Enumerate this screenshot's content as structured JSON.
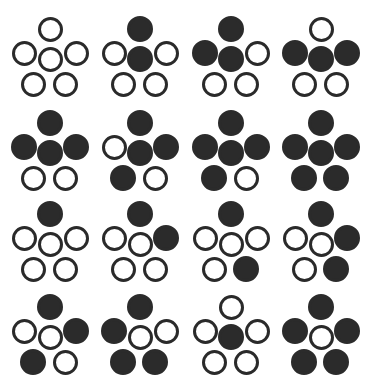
{
  "caption": {
    "text": ""
  },
  "layout": {
    "columns": 4,
    "rows": 4,
    "col_x": [
      0,
      90,
      181,
      271
    ],
    "row_y": [
      0,
      94,
      185,
      278
    ]
  },
  "colors": {
    "ink": "#2a2a2a",
    "background": "#ffffff"
  },
  "positions": [
    "top",
    "left",
    "center",
    "right",
    "bottom_left",
    "bottom_right"
  ],
  "patterns": [
    {
      "id": 1,
      "filled": {
        "top": false,
        "left": false,
        "center": false,
        "right": false,
        "bottom_left": false,
        "bottom_right": false
      }
    },
    {
      "id": 2,
      "filled": {
        "top": true,
        "left": false,
        "center": true,
        "right": false,
        "bottom_left": false,
        "bottom_right": false
      }
    },
    {
      "id": 3,
      "filled": {
        "top": true,
        "left": true,
        "center": true,
        "right": false,
        "bottom_left": false,
        "bottom_right": false
      }
    },
    {
      "id": 4,
      "filled": {
        "top": false,
        "left": true,
        "center": true,
        "right": true,
        "bottom_left": false,
        "bottom_right": false
      }
    },
    {
      "id": 5,
      "filled": {
        "top": true,
        "left": true,
        "center": true,
        "right": true,
        "bottom_left": false,
        "bottom_right": false
      }
    },
    {
      "id": 6,
      "filled": {
        "top": true,
        "left": false,
        "center": true,
        "right": true,
        "bottom_left": true,
        "bottom_right": false
      }
    },
    {
      "id": 7,
      "filled": {
        "top": true,
        "left": true,
        "center": true,
        "right": true,
        "bottom_left": true,
        "bottom_right": false
      }
    },
    {
      "id": 8,
      "filled": {
        "top": true,
        "left": true,
        "center": true,
        "right": true,
        "bottom_left": true,
        "bottom_right": true
      }
    },
    {
      "id": 9,
      "filled": {
        "top": true,
        "left": false,
        "center": false,
        "right": false,
        "bottom_left": false,
        "bottom_right": false
      }
    },
    {
      "id": 10,
      "filled": {
        "top": true,
        "left": false,
        "center": false,
        "right": true,
        "bottom_left": false,
        "bottom_right": false
      }
    },
    {
      "id": 11,
      "filled": {
        "top": true,
        "left": false,
        "center": false,
        "right": false,
        "bottom_left": false,
        "bottom_right": true
      }
    },
    {
      "id": 12,
      "filled": {
        "top": true,
        "left": false,
        "center": false,
        "right": true,
        "bottom_left": false,
        "bottom_right": true
      }
    },
    {
      "id": 13,
      "filled": {
        "top": true,
        "left": false,
        "center": false,
        "right": true,
        "bottom_left": true,
        "bottom_right": false
      }
    },
    {
      "id": 14,
      "filled": {
        "top": true,
        "left": true,
        "center": false,
        "right": false,
        "bottom_left": true,
        "bottom_right": true
      }
    },
    {
      "id": 15,
      "filled": {
        "top": false,
        "left": false,
        "center": true,
        "right": false,
        "bottom_left": false,
        "bottom_right": false
      }
    },
    {
      "id": 16,
      "filled": {
        "top": true,
        "left": true,
        "center": false,
        "right": true,
        "bottom_left": true,
        "bottom_right": true
      }
    }
  ]
}
